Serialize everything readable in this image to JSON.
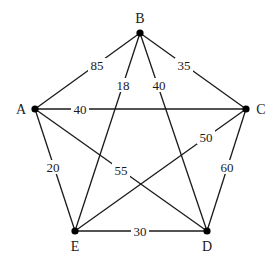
{
  "graph": {
    "type": "weighted-undirected-complete-graph",
    "nodes": [
      {
        "id": "A",
        "label": "A",
        "x": 35,
        "y": 109,
        "lx": 21,
        "ly": 109
      },
      {
        "id": "B",
        "label": "B",
        "x": 140,
        "y": 33,
        "lx": 140,
        "ly": 18
      },
      {
        "id": "C",
        "label": "C",
        "x": 246,
        "y": 109,
        "lx": 261,
        "ly": 109
      },
      {
        "id": "D",
        "label": "D",
        "x": 207,
        "y": 231,
        "lx": 207,
        "ly": 246
      },
      {
        "id": "E",
        "label": "E",
        "x": 75,
        "y": 231,
        "lx": 75,
        "ly": 246
      }
    ],
    "edges": [
      {
        "from": "A",
        "to": "B",
        "weight": "85",
        "lx": 97,
        "ly": 65
      },
      {
        "from": "B",
        "to": "E",
        "weight": "18",
        "lx": 123,
        "ly": 85
      },
      {
        "from": "B",
        "to": "C",
        "weight": "35",
        "lx": 184,
        "ly": 65
      },
      {
        "from": "B",
        "to": "D",
        "weight": "40",
        "lx": 159,
        "ly": 85
      },
      {
        "from": "A",
        "to": "C",
        "weight": "40",
        "lx": 80,
        "ly": 109
      },
      {
        "from": "C",
        "to": "E",
        "weight": "50",
        "lx": 206,
        "ly": 137
      },
      {
        "from": "C",
        "to": "D",
        "weight": "60",
        "lx": 227,
        "ly": 167
      },
      {
        "from": "A",
        "to": "E",
        "weight": "20",
        "lx": 53,
        "ly": 167
      },
      {
        "from": "A",
        "to": "D",
        "weight": "55",
        "lx": 121,
        "ly": 170
      },
      {
        "from": "E",
        "to": "D",
        "weight": "30",
        "lx": 140,
        "ly": 231
      }
    ]
  }
}
